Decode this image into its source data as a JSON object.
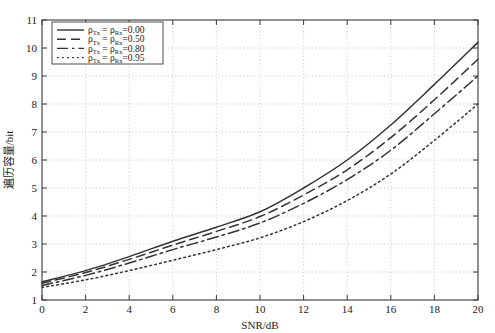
{
  "chart_data": {
    "type": "line",
    "title": "",
    "xlabel": "SNR/dB",
    "ylabel": "遍历容量/bit",
    "xlim": [
      0,
      20
    ],
    "ylim": [
      1,
      11
    ],
    "xticks": [
      0,
      2,
      4,
      6,
      8,
      10,
      12,
      14,
      16,
      18,
      20
    ],
    "yticks": [
      1,
      2,
      3,
      4,
      5,
      6,
      7,
      8,
      9,
      10,
      11
    ],
    "grid": true,
    "grid_style": "dotted",
    "legend_position": "top-left",
    "x": [
      0,
      2,
      4,
      6,
      8,
      10,
      12,
      14,
      16,
      18,
      20
    ],
    "series": [
      {
        "name": "rho_Tx = rho_Rx = 0.00",
        "label_prefix": "ρ",
        "sub1": "Tx",
        "sub2": "Rx",
        "value": "0.00",
        "style": "solid",
        "dash": "none",
        "color": "#333333",
        "values": [
          1.65,
          2.05,
          2.55,
          3.1,
          3.6,
          4.15,
          5.0,
          6.0,
          7.25,
          8.7,
          10.2
        ]
      },
      {
        "name": "rho_Tx = rho_Rx = 0.50",
        "label_prefix": "ρ",
        "sub1": "Tx",
        "sub2": "Rx",
        "value": "0.50",
        "style": "dashed",
        "dash": "9,5",
        "color": "#333333",
        "values": [
          1.6,
          1.98,
          2.45,
          2.96,
          3.45,
          3.98,
          4.75,
          5.65,
          6.8,
          8.15,
          9.6
        ]
      },
      {
        "name": "rho_Tx = rho_Rx = 0.80",
        "label_prefix": "ρ",
        "sub1": "Tx",
        "sub2": "Rx",
        "value": "0.80",
        "style": "dashdot",
        "dash": "11,4,2.5,4",
        "color": "#333333",
        "values": [
          1.52,
          1.88,
          2.32,
          2.8,
          3.25,
          3.75,
          4.45,
          5.3,
          6.35,
          7.65,
          9.0
        ]
      },
      {
        "name": "rho_Tx = rho_Rx = 0.95",
        "label_prefix": "ρ",
        "sub1": "Tx",
        "sub2": "Rx",
        "value": "0.95",
        "style": "dotted",
        "dash": "1.8,3.2",
        "color": "#333333",
        "values": [
          1.45,
          1.72,
          2.05,
          2.42,
          2.8,
          3.22,
          3.8,
          4.55,
          5.5,
          6.7,
          8.0
        ]
      }
    ]
  },
  "axes": {
    "x_title": "SNR/dB",
    "y_title": "遍历容量/bit",
    "x_tick_labels": [
      "0",
      "2",
      "4",
      "6",
      "8",
      "10",
      "12",
      "14",
      "16",
      "18",
      "20"
    ],
    "y_tick_labels": [
      "1",
      "2",
      "3",
      "4",
      "5",
      "6",
      "7",
      "8",
      "9",
      "10",
      "11"
    ]
  },
  "legend": {
    "entries": [
      {
        "prefix": "ρ",
        "sub1": "Tx",
        "eq1": "=",
        "sub2": "Rx",
        "eq2": "=",
        "value": "0.00"
      },
      {
        "prefix": "ρ",
        "sub1": "Tx",
        "eq1": "=",
        "sub2": "Rx",
        "eq2": "=",
        "value": "0.50"
      },
      {
        "prefix": "ρ",
        "sub1": "Tx",
        "eq1": "=",
        "sub2": "Rx",
        "eq2": "=",
        "value": "0.80"
      },
      {
        "prefix": "ρ",
        "sub1": "Tx",
        "eq1": "=",
        "sub2": "Rx",
        "eq2": "=",
        "value": "0.95"
      }
    ]
  },
  "colors": {
    "line": "#333333",
    "axis": "#3a3a3a",
    "grid": "#b8b8b8",
    "background": "#ffffff"
  }
}
